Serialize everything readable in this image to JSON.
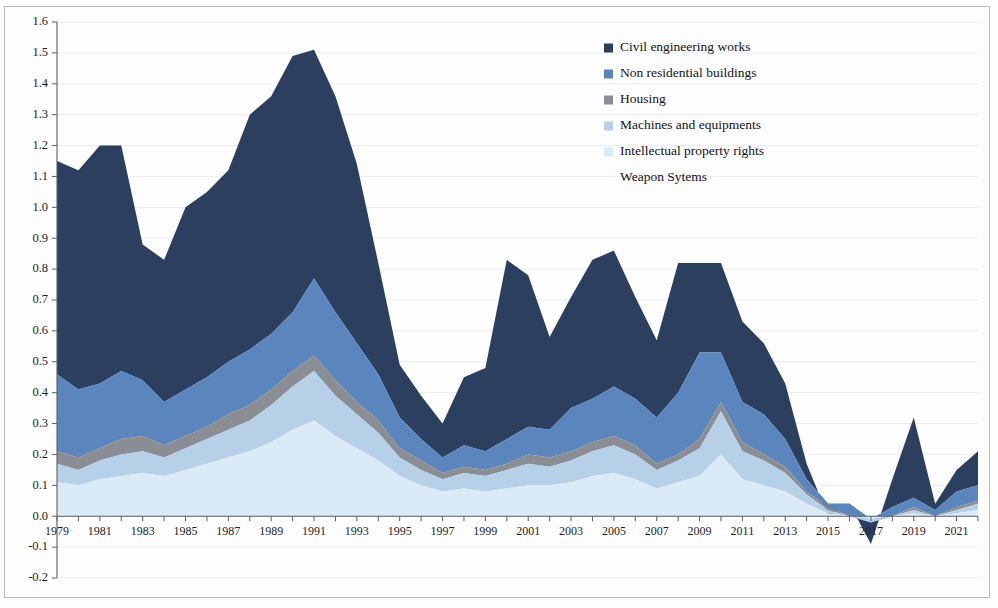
{
  "figure": {
    "kind": "stacked-area-chart",
    "background": "#ffffff"
  },
  "legend": {
    "position": "top-right-inside",
    "items": [
      {
        "label": "Civil engineering works",
        "color": "#2d3f5e",
        "swatch": true
      },
      {
        "label": "Non residential buildings",
        "color": "#5b86bd",
        "swatch": true
      },
      {
        "label": "Housing",
        "color": "#8a8e94",
        "swatch": true
      },
      {
        "label": "Machines and equipments",
        "color": "#b6d0e8",
        "swatch": true
      },
      {
        "label": "Intellectual property rights",
        "color": "#dbeaf7",
        "swatch": true
      },
      {
        "label": "Weapon Sytems",
        "color": "#f2f7fc",
        "swatch": false
      }
    ]
  },
  "axes": {
    "y": {
      "min": -0.2,
      "max": 1.6,
      "step": 0.1,
      "tick_labels": [
        "1.6",
        "1.5",
        "1.4",
        "1.3",
        "1.2",
        "1.1",
        "1.0",
        "0.9",
        "0.8",
        "0.7",
        "0.6",
        "0.5",
        "0.4",
        "0.3",
        "0.2",
        "0.1",
        "0.0",
        "-0.1",
        "-0.2"
      ],
      "grid": true
    },
    "x": {
      "min": 1979,
      "max": 2022,
      "label_step": 2,
      "tick_labels": [
        "1979",
        "1981",
        "1983",
        "1985",
        "1987",
        "1989",
        "1991",
        "1993",
        "1995",
        "1997",
        "1999",
        "2001",
        "2003",
        "2005",
        "2007",
        "2009",
        "2011",
        "2013",
        "2015",
        "2017",
        "2019",
        "2021"
      ]
    }
  },
  "chart_data": {
    "type": "area",
    "stacked": true,
    "title": "",
    "xlabel": "",
    "ylabel": "",
    "ylim": [
      -0.2,
      1.6
    ],
    "xlim": [
      1979,
      2022
    ],
    "grid": true,
    "legend_position": "top-right",
    "x": [
      1979,
      1980,
      1981,
      1982,
      1983,
      1984,
      1985,
      1986,
      1987,
      1988,
      1989,
      1990,
      1991,
      1992,
      1993,
      1994,
      1995,
      1996,
      1997,
      1998,
      1999,
      2000,
      2001,
      2002,
      2003,
      2004,
      2005,
      2006,
      2007,
      2008,
      2009,
      2010,
      2011,
      2012,
      2013,
      2014,
      2015,
      2016,
      2017,
      2018,
      2019,
      2020,
      2021,
      2022
    ],
    "series": [
      {
        "name": "Intellectual property rights",
        "color": "#dbeaf7",
        "values": [
          0.11,
          0.1,
          0.12,
          0.13,
          0.14,
          0.13,
          0.15,
          0.17,
          0.19,
          0.21,
          0.24,
          0.28,
          0.31,
          0.26,
          0.22,
          0.18,
          0.13,
          0.1,
          0.08,
          0.09,
          0.08,
          0.09,
          0.1,
          0.1,
          0.11,
          0.13,
          0.14,
          0.12,
          0.09,
          0.11,
          0.13,
          0.2,
          0.12,
          0.1,
          0.08,
          0.04,
          0.01,
          0.0,
          -0.01,
          0.0,
          0.01,
          0.0,
          0.01,
          0.02
        ]
      },
      {
        "name": "Machines and equipments",
        "color": "#b6d0e8",
        "values": [
          0.06,
          0.05,
          0.06,
          0.07,
          0.07,
          0.06,
          0.07,
          0.08,
          0.09,
          0.1,
          0.12,
          0.14,
          0.16,
          0.13,
          0.11,
          0.09,
          0.06,
          0.05,
          0.04,
          0.05,
          0.05,
          0.06,
          0.07,
          0.06,
          0.07,
          0.08,
          0.09,
          0.08,
          0.06,
          0.07,
          0.09,
          0.14,
          0.09,
          0.08,
          0.06,
          0.03,
          0.01,
          0.0,
          -0.01,
          0.0,
          0.01,
          0.0,
          0.01,
          0.02
        ]
      },
      {
        "name": "Housing",
        "color": "#8a8e94",
        "values": [
          0.04,
          0.04,
          0.04,
          0.05,
          0.05,
          0.04,
          0.04,
          0.04,
          0.05,
          0.05,
          0.05,
          0.05,
          0.05,
          0.05,
          0.04,
          0.04,
          0.03,
          0.03,
          0.02,
          0.02,
          0.02,
          0.02,
          0.03,
          0.03,
          0.03,
          0.03,
          0.03,
          0.03,
          0.02,
          0.02,
          0.03,
          0.03,
          0.03,
          0.02,
          0.02,
          0.01,
          0.01,
          0.0,
          0.0,
          0.0,
          0.01,
          0.0,
          0.01,
          0.01
        ]
      },
      {
        "name": "Non residential buildings",
        "color": "#5b86bd",
        "values": [
          0.25,
          0.22,
          0.21,
          0.22,
          0.18,
          0.14,
          0.15,
          0.16,
          0.17,
          0.18,
          0.18,
          0.19,
          0.25,
          0.22,
          0.19,
          0.15,
          0.1,
          0.07,
          0.05,
          0.07,
          0.06,
          0.08,
          0.09,
          0.09,
          0.14,
          0.14,
          0.16,
          0.15,
          0.15,
          0.2,
          0.28,
          0.16,
          0.13,
          0.13,
          0.09,
          0.04,
          0.01,
          0.04,
          0.01,
          0.03,
          0.03,
          0.02,
          0.05,
          0.05
        ]
      },
      {
        "name": "Civil engineering works",
        "color": "#2d3f5e",
        "values": [
          0.69,
          0.71,
          0.77,
          0.73,
          0.44,
          0.46,
          0.59,
          0.6,
          0.62,
          0.76,
          0.77,
          0.83,
          0.74,
          0.7,
          0.58,
          0.36,
          0.17,
          0.14,
          0.11,
          0.22,
          0.27,
          0.58,
          0.49,
          0.3,
          0.36,
          0.45,
          0.44,
          0.33,
          0.25,
          0.42,
          0.29,
          0.29,
          0.26,
          0.23,
          0.18,
          0.05,
          -0.04,
          0.0,
          -0.08,
          0.09,
          0.26,
          0.02,
          0.07,
          0.11
        ]
      },
      {
        "name": "Weapon Sytems",
        "color": "#f2f7fc",
        "values": [
          0.0,
          0.0,
          0.0,
          0.0,
          0.0,
          0.0,
          0.0,
          0.0,
          0.0,
          0.0,
          0.0,
          0.0,
          0.0,
          0.0,
          0.0,
          0.0,
          0.0,
          0.0,
          0.0,
          0.0,
          0.0,
          0.0,
          0.0,
          0.0,
          0.0,
          0.0,
          0.0,
          0.0,
          0.0,
          0.0,
          0.0,
          0.0,
          0.0,
          0.0,
          0.0,
          0.0,
          0.0,
          0.0,
          0.0,
          0.0,
          0.0,
          0.0,
          0.0,
          0.0
        ]
      }
    ]
  }
}
